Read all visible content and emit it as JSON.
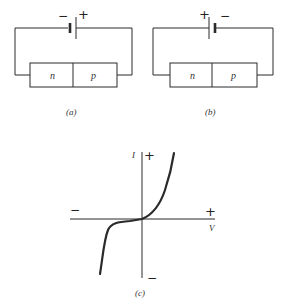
{
  "figure": {
    "panel_a": {
      "caption": "(a)",
      "battery_left_sign": "−",
      "battery_right_sign": "+",
      "region_left": "n",
      "region_right": "p"
    },
    "panel_b": {
      "caption": "(b)",
      "battery_left_sign": "+",
      "battery_right_sign": "−",
      "region_left": "n",
      "region_right": "p"
    },
    "panel_c": {
      "caption": "(c)",
      "y_axis_label": "I",
      "y_axis_positive": "+",
      "y_axis_negative": "−",
      "x_axis_label": "V",
      "x_axis_positive": "+",
      "x_axis_negative": "−"
    }
  },
  "colors": {
    "line": "#2a2a2a",
    "background": "#ffffff"
  }
}
